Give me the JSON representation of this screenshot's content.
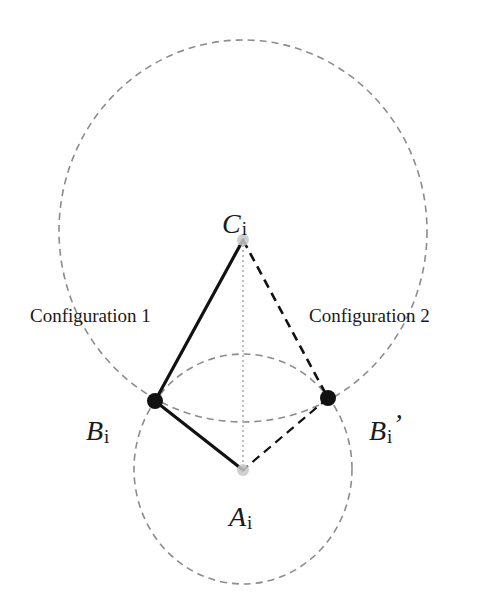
{
  "diagram": {
    "type": "geometric-construction",
    "colors": {
      "background": "#ffffff",
      "circle_dashed": "#8c8c8c",
      "solid_link": "#111111",
      "dashed_link": "#111111",
      "dotted_axis": "#bdbdbd",
      "joint_fill": "#111111",
      "fixed_point_fill": "#c8c8c8"
    },
    "circles": [
      {
        "name": "outer-circle-around-C",
        "cx": 243,
        "cy": 231,
        "rx": 184,
        "ry": 191,
        "style": "dashed"
      },
      {
        "name": "inner-circle-around-A",
        "cx": 243,
        "cy": 469,
        "rx": 109,
        "ry": 115,
        "style": "dashed"
      }
    ],
    "points": {
      "C": {
        "x": 243,
        "y": 240,
        "letter": "C",
        "subscript": "i",
        "prime": ""
      },
      "B": {
        "x": 155,
        "y": 401,
        "letter": "B",
        "subscript": "i",
        "prime": ""
      },
      "B_prime": {
        "x": 328,
        "y": 398,
        "letter": "B",
        "subscript": "i",
        "prime": "’"
      },
      "A": {
        "x": 243,
        "y": 470,
        "letter": "A",
        "subscript": "i",
        "prime": ""
      }
    },
    "links": [
      {
        "from": "C",
        "to": "B",
        "style": "solid",
        "configuration": "Configuration 1"
      },
      {
        "from": "B",
        "to": "A",
        "style": "solid",
        "configuration": "Configuration 1"
      },
      {
        "from": "C",
        "to": "B_prime",
        "style": "dashed",
        "configuration": "Configuration 2"
      },
      {
        "from": "B_prime",
        "to": "A",
        "style": "dashed",
        "configuration": "Configuration 2"
      },
      {
        "from": "C",
        "to": "A",
        "style": "dotted"
      }
    ],
    "labels": {
      "config1": "Configuration 1",
      "config2": "Configuration 2",
      "C_letter": "C",
      "C_sub": "i",
      "B_letter": "B",
      "B_sub": "i",
      "Bp_letter": "B",
      "Bp_sub": "i",
      "Bp_prime": "’",
      "A_letter": "A",
      "A_sub": "i"
    }
  }
}
